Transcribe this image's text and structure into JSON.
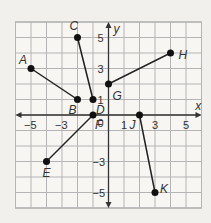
{
  "chart_data": {
    "type": "scatter",
    "title": "",
    "xlabel": "x",
    "ylabel": "y",
    "xlim": [
      -6,
      6
    ],
    "ylim": [
      -6,
      6
    ],
    "grid": true,
    "x_ticks": [
      "-5",
      "-3",
      "1",
      "3",
      "5"
    ],
    "y_ticks": [
      "5",
      "3",
      "1",
      "-3",
      "-5"
    ],
    "origin_label": "0",
    "points": [
      {
        "name": "A",
        "x": -5,
        "y": 3
      },
      {
        "name": "B",
        "x": -2,
        "y": 1
      },
      {
        "name": "C",
        "x": -2,
        "y": 5
      },
      {
        "name": "D",
        "x": -1,
        "y": 1
      },
      {
        "name": "G",
        "x": 0,
        "y": 2
      },
      {
        "name": "H",
        "x": 4,
        "y": 4
      },
      {
        "name": "E",
        "x": -4,
        "y": -3
      },
      {
        "name": "F",
        "x": -1,
        "y": 0
      },
      {
        "name": "J",
        "x": 2,
        "y": 0
      },
      {
        "name": "K",
        "x": 3,
        "y": -5
      }
    ],
    "segments": [
      [
        "A",
        "B"
      ],
      [
        "C",
        "D"
      ],
      [
        "G",
        "H"
      ],
      [
        "E",
        "F"
      ],
      [
        "J",
        "K"
      ]
    ]
  }
}
